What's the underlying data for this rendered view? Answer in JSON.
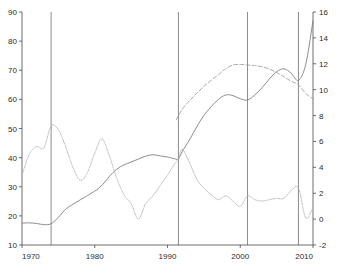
{
  "chart_data": {
    "type": "line",
    "title": "",
    "xlabel": "",
    "ylabel": "",
    "xlim": [
      1970,
      2010
    ],
    "grid": false,
    "legend_position": "none",
    "axes": {
      "left": {
        "label": "",
        "ylim": [
          10,
          90
        ],
        "ticks": [
          10,
          20,
          30,
          40,
          50,
          60,
          70,
          80,
          90
        ],
        "tick_labels": [
          "10",
          "20",
          "30",
          "40",
          "50",
          "60",
          "70",
          "80",
          "90"
        ]
      },
      "right": {
        "label": "",
        "ylim": [
          -2,
          16
        ],
        "ticks": [
          -2,
          0,
          2,
          4,
          6,
          8,
          10,
          12,
          14,
          16
        ],
        "tick_labels": [
          "-2",
          "0",
          "2",
          "4",
          "6",
          "8",
          "10",
          "12",
          "14",
          "16"
        ]
      },
      "bottom": {
        "ticks": [
          1970,
          1980,
          1990,
          2000,
          2010
        ],
        "tick_labels": [
          "1970",
          "1980",
          "1990",
          "2000",
          "2010"
        ]
      }
    },
    "vertical_markers": [
      {
        "x": 1974.0,
        "name": "marker-1974"
      },
      {
        "x": 1991.5,
        "name": "marker-1991"
      },
      {
        "x": 2001.0,
        "name": "marker-2001"
      },
      {
        "x": 2008.0,
        "name": "marker-2008"
      }
    ],
    "series": [
      {
        "name": "solid-rising-series",
        "axis": "left",
        "style": "solid",
        "color": "#7a7a7a",
        "x": [
          1970,
          1971,
          1972,
          1973,
          1974,
          1975,
          1976,
          1977,
          1978,
          1979,
          1980,
          1981,
          1982,
          1983,
          1984,
          1985,
          1986,
          1987,
          1988,
          1989,
          1990,
          1991,
          1991.5,
          1992,
          1993,
          1994,
          1995,
          1996,
          1997,
          1998,
          1999,
          2000,
          2001,
          2002,
          2003,
          2004,
          2005,
          2006,
          2007,
          2008,
          2009,
          2010
        ],
        "values": [
          17.5,
          17.6,
          17.4,
          17.0,
          17.3,
          19.5,
          22.3,
          24.0,
          25.5,
          27.0,
          28.5,
          30.5,
          33.5,
          36.0,
          37.5,
          38.5,
          39.5,
          40.5,
          41.0,
          40.6,
          40.2,
          39.6,
          39.5,
          42.0,
          46.0,
          50.5,
          54.5,
          57.5,
          60.0,
          61.5,
          61.3,
          60.2,
          59.8,
          61.5,
          64.0,
          67.0,
          69.5,
          70.5,
          69.0,
          66.5,
          72.0,
          87.0
        ]
      },
      {
        "name": "dashed-upper-series",
        "axis": "left",
        "style": "dashed",
        "color": "#9a9a9a",
        "x": [
          1991.2,
          1992,
          1993,
          1994,
          1995,
          1996,
          1997,
          1998,
          1999,
          2000,
          2001,
          2002,
          2003,
          2004,
          2005,
          2006,
          2007,
          2008,
          2009,
          2010
        ],
        "values": [
          53.0,
          56.5,
          59.5,
          62.0,
          64.5,
          66.5,
          68.5,
          70.5,
          71.8,
          72.0,
          71.8,
          71.6,
          71.2,
          70.4,
          69.2,
          67.8,
          66.2,
          65.0,
          62.0,
          60.2
        ]
      },
      {
        "name": "dotted-right-axis-series",
        "axis": "right",
        "style": "dotted",
        "color": "#b0b0b0",
        "x": [
          1970,
          1971,
          1972,
          1973,
          1974,
          1975,
          1976,
          1977,
          1978,
          1979,
          1980,
          1981,
          1982,
          1983,
          1984,
          1985,
          1986,
          1987,
          1988,
          1989,
          1990,
          1991,
          1991.5,
          1992,
          1993,
          1994,
          1995,
          1996,
          1997,
          1998,
          1999,
          2000,
          2001,
          2002,
          2003,
          2004,
          2005,
          2006,
          2007,
          2008,
          2009,
          2010
        ],
        "values_right_axis": [
          3.4,
          5.0,
          5.6,
          5.5,
          7.2,
          6.9,
          5.6,
          4.0,
          3.0,
          3.6,
          5.1,
          6.2,
          4.9,
          3.2,
          1.9,
          1.2,
          0.0,
          1.2,
          1.8,
          2.6,
          3.4,
          4.3,
          4.6,
          5.4,
          4.4,
          3.1,
          2.4,
          1.9,
          1.5,
          1.8,
          1.4,
          1.0,
          1.8,
          1.5,
          1.4,
          1.5,
          1.6,
          1.6,
          2.2,
          2.4,
          0.1,
          0.9
        ]
      }
    ]
  },
  "ghost_header": {
    "text": ""
  }
}
